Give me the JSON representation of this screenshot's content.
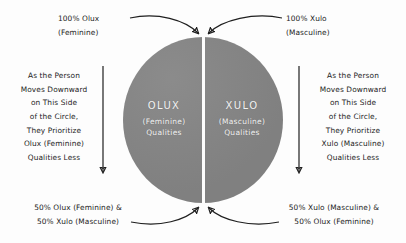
{
  "diagram": {
    "background_color": "#fdfdfd",
    "circle_color": "#858585",
    "text_color": "#1c1c1c",
    "circle_text_color": "#f2f2f2"
  },
  "circle": {
    "left_half": {
      "title": "OLUX",
      "subtitle": "(Feminine)",
      "subtitle2": "Qualities"
    },
    "right_half": {
      "title": "XULO",
      "subtitle": "(Masculine)",
      "subtitle2": "Qualities"
    },
    "divider": "vertical-white-line"
  },
  "notes": {
    "top_left": "100% Olux\n(Feminine)",
    "top_right": "100% Xulo\n(Masculine)",
    "side_left": "As the Person\nMoves Downward\non This Side\nof the Circle,\nThey Prioritize\nOlux (Feminine)\nQualities Less",
    "side_right": "As the Person\nMoves Downward\non This Side\nof the Circle,\nThey Prioritize\nXulo (Masculine)\nQualities Less",
    "bottom_left": "50% Olux (Feminine) &\n50% Xulo (Masculine)",
    "bottom_right": "50% Xulo (Masculine) &\n50% Olux (Feminine)"
  },
  "arrows": {
    "top_left_curve": "curved-arrow-down-right",
    "top_right_curve": "curved-arrow-down-left",
    "left_vertical": "arrow-down",
    "right_vertical": "arrow-down",
    "bottom_left_curve": "curved-arrow-up-right",
    "bottom_right_curve": "curved-arrow-up-left"
  }
}
